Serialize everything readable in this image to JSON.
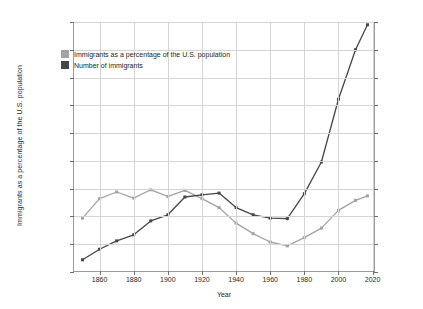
{
  "chart_data": {
    "type": "line",
    "title": "",
    "xlabel": "Year",
    "ylabel": "Immigrants as a percentage of the U.S. population",
    "ylabel_right": "",
    "xlim": [
      1845,
      2022
    ],
    "ylim": [
      0,
      45
    ],
    "ylim_right": [
      0,
      45
    ],
    "grid": true,
    "legend_position": "upper-left-inside",
    "x_ticks": [
      "1860",
      "1880",
      "1900",
      "1920",
      "1940",
      "1960",
      "1980",
      "2000",
      "2020"
    ],
    "x_tick_values": [
      1860,
      1880,
      1900,
      1920,
      1940,
      1960,
      1980,
      2000,
      2020
    ],
    "y_ticks_left": [
      "0.0%",
      "5.0%",
      "10.0%",
      "15.0%",
      "20.0%",
      "25.0%",
      "30.0%",
      "35.0%",
      "40.0%",
      "45.0%"
    ],
    "y_tick_values_left": [
      0,
      5,
      10,
      15,
      20,
      25,
      30,
      35,
      40,
      45
    ],
    "y_ticks_right": [
      "0M",
      "5M",
      "10M",
      "15M",
      "20M",
      "25M",
      "30M",
      "35M",
      "40M",
      "45M"
    ],
    "y_tick_values_right": [
      0,
      5,
      10,
      15,
      20,
      25,
      30,
      35,
      40,
      45
    ],
    "x": [
      1850,
      1860,
      1870,
      1880,
      1890,
      1900,
      1910,
      1920,
      1930,
      1940,
      1950,
      1960,
      1970,
      1980,
      1990,
      2000,
      2010,
      2017
    ],
    "series": [
      {
        "name": "Immigrants as a percentage of the U.S. population",
        "color": "#a3a3a3",
        "axis": "left",
        "unit": "%",
        "values": [
          9.7,
          13.2,
          14.4,
          13.3,
          14.8,
          13.6,
          14.7,
          13.2,
          11.6,
          8.8,
          6.9,
          5.4,
          4.7,
          6.2,
          7.9,
          11.1,
          12.9,
          13.7
        ]
      },
      {
        "name": "Number of immigrants",
        "color": "#464646",
        "axis": "right",
        "unit": "M",
        "values": [
          2.2,
          4.1,
          5.6,
          6.7,
          9.2,
          10.3,
          13.5,
          13.9,
          14.2,
          11.6,
          10.3,
          9.7,
          9.6,
          14.1,
          19.8,
          31.1,
          40.0,
          44.5
        ]
      }
    ],
    "legend": [
      {
        "label": "Immigrants as a percentage of the U.S. population",
        "color": "#a3a3a3"
      },
      {
        "label": "Number of immigrants",
        "color": "#464646"
      }
    ]
  },
  "colors": {
    "background": "#ffffff",
    "grid": "#d4d4d4",
    "axis": "#9b9b9b",
    "text": "#231f20",
    "series_light": "#a3a3a3",
    "series_dark": "#464646"
  }
}
